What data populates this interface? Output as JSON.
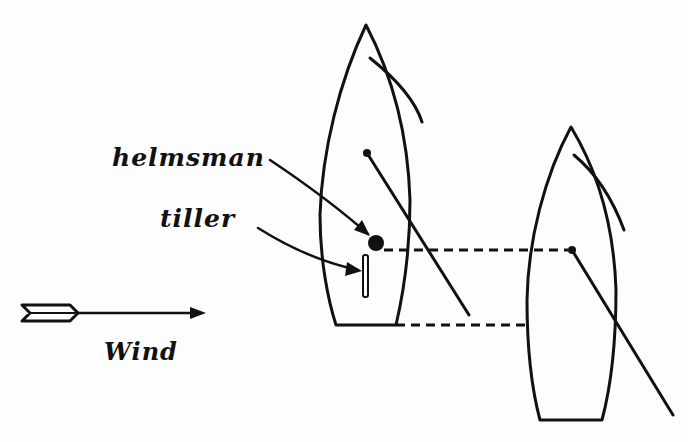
{
  "diagram": {
    "type": "sailing-diagram",
    "labels": {
      "helmsman": "helmsman",
      "tiller": "tiller",
      "wind": "Wind"
    },
    "elements": {
      "boats": [
        {
          "name": "left-boat",
          "has_helmsman": true,
          "has_tiller": true
        },
        {
          "name": "right-boat",
          "has_helmsman": false,
          "has_tiller": false
        }
      ],
      "wind_direction": "left-to-right",
      "connectors": [
        "dashed line from helmsman to right boat mast",
        "dashed line from left boat stern to right boat"
      ]
    },
    "colors": {
      "ink": "#111111",
      "background": "#fdfdfd"
    }
  }
}
